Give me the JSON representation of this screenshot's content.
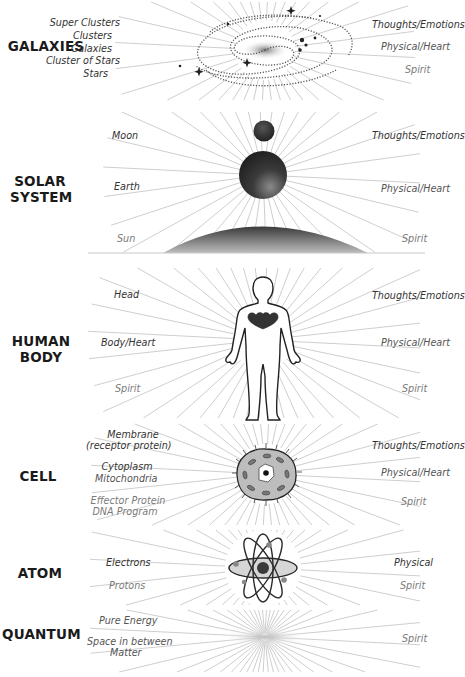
{
  "figure": {
    "width": 463,
    "height": 677,
    "ray_color": "#c8c8c8",
    "text_color": "#333333",
    "dim_text_color": "#7a7a7a",
    "title_color": "#1a1a1a"
  },
  "sections": [
    {
      "id": "galaxies",
      "title": "GALAXIES",
      "left_labels": [
        "Super Clusters",
        "Clusters",
        "Galaxies",
        "Cluster of Stars",
        "Stars"
      ],
      "right_labels": [
        "Thoughts/Emotions",
        "Physical/Heart",
        "Spirit"
      ],
      "center_image": "spiral-galaxy"
    },
    {
      "id": "solar-system",
      "title": "SOLAR SYSTEM",
      "title_lines": [
        "SOLAR",
        "SYSTEM"
      ],
      "left_labels": [
        "Moon",
        "Earth",
        "Sun"
      ],
      "right_labels": [
        "Thoughts/Emotions",
        "Physical/Heart",
        "Spirit"
      ],
      "center_image": "moon-earth-sun"
    },
    {
      "id": "human-body",
      "title": "HUMAN BODY",
      "title_lines": [
        "HUMAN",
        "BODY"
      ],
      "left_labels": [
        "Head",
        "Body/Heart",
        "Spirit"
      ],
      "right_labels": [
        "Thoughts/Emotions",
        "Physical/Heart",
        "Spirit"
      ],
      "center_image": "human-silhouette-with-heart"
    },
    {
      "id": "cell",
      "title": "CELL",
      "left_labels": [
        "Membrane",
        "(receptor protein)",
        "Cytoplasm",
        "Mitochondria",
        "Effector Protein",
        "DNA Program"
      ],
      "right_labels": [
        "Thoughts/Emotions",
        "Physical/Heart",
        "Spirit"
      ],
      "center_image": "cell"
    },
    {
      "id": "atom",
      "title": "ATOM",
      "left_labels": [
        "Electrons",
        "Protons"
      ],
      "right_labels": [
        "Physical",
        "Spirit"
      ],
      "center_image": "atom"
    },
    {
      "id": "quantum",
      "title": "QUANTUM",
      "left_labels": [
        "Pure Energy",
        "Space in between",
        "Matter"
      ],
      "right_labels": [
        "Spirit"
      ],
      "center_image": "energy-haze"
    }
  ]
}
